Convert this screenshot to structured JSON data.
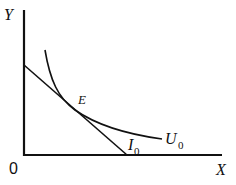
{
  "diagram": {
    "type": "indifference-curve-budget-line",
    "axes": {
      "y_label": "Y",
      "x_label": "X",
      "origin_label": "0"
    },
    "curves": {
      "indifference_curve": {
        "label": "U",
        "subscript": "0"
      },
      "budget_line": {
        "label": "I",
        "subscript": "0"
      }
    },
    "points": {
      "tangency": {
        "label": "E"
      }
    },
    "colors": {
      "line": "#111111",
      "background": "#ffffff"
    }
  }
}
